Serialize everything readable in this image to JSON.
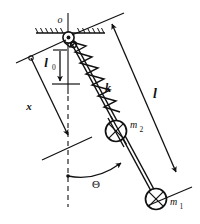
{
  "figure": {
    "type": "mechanics-schematic",
    "background_color": "#ffffff",
    "line_color": "#111111"
  },
  "labels": {
    "pivot": "o",
    "natural_length": "l",
    "natural_length_subscript": "0",
    "displacement": "x",
    "spring_constant": "k",
    "rod_length": "l",
    "angle": "Θ",
    "mass_upper": "m",
    "mass_upper_subscript": "2",
    "mass_lower": "m",
    "mass_lower_subscript": "1"
  },
  "geometry": {
    "pivot": {
      "x": 68,
      "y": 37
    },
    "mass2_center": {
      "x": 116,
      "y": 131
    },
    "mass1_center": {
      "x": 156,
      "y": 200
    },
    "ceiling_y": 33,
    "ceiling_x_start": 36,
    "ceiling_x_end": 105,
    "rod_angle_deg": 27,
    "vertical_dash_x": 68
  },
  "elements": {
    "ceiling": "hatched-fixed-support",
    "pivot_joint": "pin-joint-circle",
    "spring": "coil-spring-zigzag",
    "rod": "rigid-rod-double-line",
    "mass_2": "circle-with-cross",
    "mass_1": "circle-with-cross",
    "angle_arc": "curved-arrow-theta",
    "dimension_l0": "arrow-down-vertical",
    "dimension_x": "arrow-down-slanted",
    "dimension_l": "double-arrow-slanted"
  }
}
